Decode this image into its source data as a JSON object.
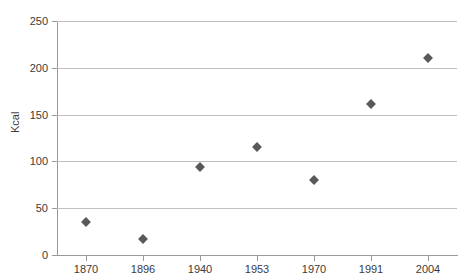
{
  "chart_data": {
    "type": "scatter",
    "title": "",
    "subtitle": "",
    "xlabel": "",
    "ylabel": "Kcal",
    "categories": [
      "1870",
      "1896",
      "1940",
      "1953",
      "1970",
      "1991",
      "2004"
    ],
    "values": [
      35,
      17,
      94,
      115,
      80,
      161,
      210
    ],
    "series": [
      {
        "name": "Kcal",
        "values": [
          35,
          17,
          94,
          115,
          80,
          161,
          210
        ]
      }
    ],
    "ylim": [
      0,
      250
    ],
    "y_ticks": [
      "0",
      "50",
      "100",
      "150",
      "200",
      "250"
    ],
    "y_tick_values": [
      0,
      50,
      100,
      150,
      200,
      250
    ],
    "grid": "horizontal",
    "legend": "none",
    "marker": "diamond",
    "marker_color": "#595959",
    "gridline_color": "#c0c0c0",
    "axis_color": "#9a9a9a",
    "background_color": "#ffffff"
  }
}
